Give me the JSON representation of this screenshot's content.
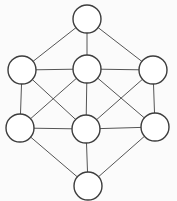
{
  "diagram": {
    "type": "graph",
    "title": "",
    "background_color": "#fbfbfb",
    "node_style": {
      "fill": "#ffffff",
      "stroke": "#3d3d3d",
      "stroke_width": 1.4,
      "radius": 14
    },
    "edge_style": {
      "stroke": "#555555",
      "stroke_width": 1
    },
    "nodes": [
      {
        "id": "top",
        "x": 87,
        "y": 19
      },
      {
        "id": "mid-left",
        "x": 22,
        "y": 70
      },
      {
        "id": "mid-center",
        "x": 87,
        "y": 69
      },
      {
        "id": "mid-right",
        "x": 153,
        "y": 70
      },
      {
        "id": "lower-left",
        "x": 20,
        "y": 128
      },
      {
        "id": "lower-center",
        "x": 86,
        "y": 129
      },
      {
        "id": "lower-right",
        "x": 155,
        "y": 127
      },
      {
        "id": "bottom",
        "x": 88,
        "y": 186
      }
    ],
    "edges": [
      [
        "top",
        "mid-left"
      ],
      [
        "top",
        "mid-center"
      ],
      [
        "top",
        "mid-right"
      ],
      [
        "mid-left",
        "mid-center"
      ],
      [
        "mid-center",
        "mid-right"
      ],
      [
        "mid-left",
        "lower-left"
      ],
      [
        "mid-left",
        "lower-center"
      ],
      [
        "mid-center",
        "lower-left"
      ],
      [
        "mid-center",
        "lower-center"
      ],
      [
        "mid-center",
        "lower-right"
      ],
      [
        "mid-right",
        "lower-center"
      ],
      [
        "mid-right",
        "lower-right"
      ],
      [
        "lower-left",
        "lower-center"
      ],
      [
        "lower-center",
        "lower-right"
      ],
      [
        "lower-left",
        "bottom"
      ],
      [
        "lower-center",
        "bottom"
      ],
      [
        "lower-right",
        "bottom"
      ]
    ]
  }
}
